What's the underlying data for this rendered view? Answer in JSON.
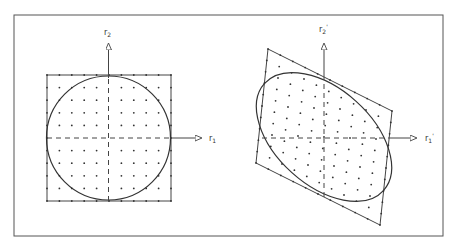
{
  "figure": {
    "type": "diagram",
    "colors": {
      "line": "#444444",
      "frame": "#555555",
      "dot": "#333333",
      "background": "#ffffff"
    },
    "left_panel": {
      "x_axis_label": "r",
      "x_axis_sub": "1",
      "y_axis_label": "r",
      "y_axis_sub": "2",
      "shape": "square",
      "inscribed": "circle"
    },
    "right_panel": {
      "x_axis_label": "r",
      "x_axis_sub": "1",
      "x_axis_prime": "'",
      "y_axis_label": "r",
      "y_axis_sub": "2",
      "y_axis_prime": "'",
      "shape": "parallelogram",
      "inscribed": "ellipse"
    }
  }
}
